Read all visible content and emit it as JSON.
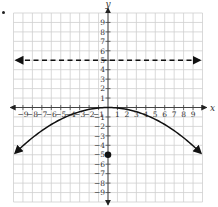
{
  "chart_data": {
    "type": "line",
    "title": "",
    "xlabel": "x",
    "ylabel": "y",
    "xlim": [
      -10,
      10
    ],
    "ylim": [
      -10,
      10
    ],
    "grid": true,
    "x_ticks": [
      -9,
      -8,
      -7,
      -6,
      -5,
      -4,
      -3,
      -2,
      -1,
      1,
      2,
      3,
      4,
      5,
      6,
      7,
      8,
      9
    ],
    "y_ticks": [
      9,
      8,
      7,
      6,
      5,
      4,
      3,
      2,
      1,
      -1,
      -2,
      -3,
      -4,
      -5,
      -6,
      -7,
      -8,
      -9
    ],
    "series": [
      {
        "name": "parabola",
        "style": "solid",
        "equation": "y = -x^2/20",
        "vertex": [
          0,
          0
        ],
        "arrows": "both ends",
        "x": [
          -10,
          -8,
          -6,
          -4,
          -2,
          0,
          2,
          4,
          6,
          8,
          10
        ],
        "y": [
          -5,
          -3.2,
          -1.8,
          -0.8,
          -0.2,
          0,
          -0.2,
          -0.8,
          -1.8,
          -3.2,
          -5
        ]
      },
      {
        "name": "directrix",
        "style": "dashed",
        "equation": "y = 5",
        "arrows": "both ends",
        "x": [
          -10,
          10
        ],
        "y": [
          5,
          5
        ]
      },
      {
        "name": "focus",
        "style": "point",
        "x": [
          0
        ],
        "y": [
          -5
        ]
      }
    ]
  },
  "axis_labels": {
    "x": "x",
    "y": "y"
  }
}
